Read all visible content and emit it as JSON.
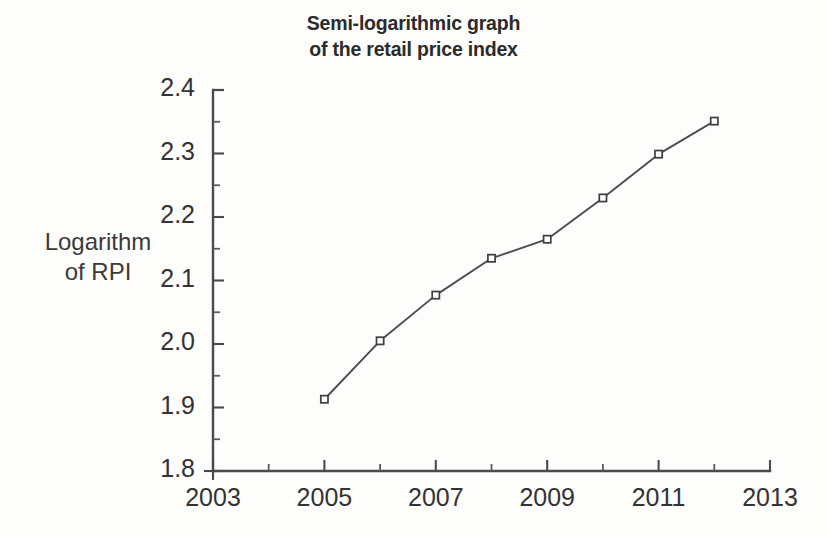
{
  "title": {
    "line1": "Semi-logarithmic graph",
    "line2": "of the retail price index"
  },
  "y_axis_title": {
    "line1": "Logarithm",
    "line2": "of RPI"
  },
  "chart_data": {
    "type": "line",
    "title": "Semi-logarithmic graph of the retail price index",
    "subtitle": "",
    "xlabel": "",
    "ylabel": "Logarithm of RPI",
    "xlim": [
      2003,
      2013
    ],
    "ylim": [
      1.8,
      2.4
    ],
    "grid": false,
    "legend": "none",
    "x_tick_labels": [
      "2003",
      "2005",
      "2007",
      "2009",
      "2011",
      "2013"
    ],
    "x_tick_values": [
      2003,
      2005,
      2007,
      2009,
      2011,
      2013
    ],
    "x_minor_tick_values": [
      2004,
      2006,
      2008,
      2010,
      2012
    ],
    "y_tick_labels": [
      "1.8",
      "1.9",
      "2.0",
      "2.1",
      "2.2",
      "2.3",
      "2.4"
    ],
    "y_tick_values": [
      1.8,
      1.9,
      2.0,
      2.1,
      2.2,
      2.3,
      2.4
    ],
    "y_minor_tick_values": [
      1.85,
      1.95,
      2.05,
      2.15,
      2.25,
      2.35
    ],
    "marker": "open-square",
    "line_color": "#4c4c53",
    "marker_face_color": "#ffffff",
    "marker_edge_color": "#3d3d44",
    "x": [
      2005,
      2006,
      2007,
      2008,
      2009,
      2010,
      2011,
      2012
    ],
    "values": [
      1.913,
      2.005,
      2.077,
      2.135,
      2.165,
      2.23,
      2.299,
      2.351
    ],
    "series": [
      {
        "name": "Logarithm of RPI",
        "x": [
          2005,
          2006,
          2007,
          2008,
          2009,
          2010,
          2011,
          2012
        ],
        "values": [
          1.913,
          2.005,
          2.077,
          2.135,
          2.165,
          2.23,
          2.299,
          2.351
        ]
      }
    ]
  },
  "geometry": {
    "plot_left": 213,
    "plot_right": 770,
    "plot_top": 90,
    "plot_bottom": 471
  },
  "colors": {
    "background": "#fdfdfc",
    "ink": "#333333",
    "axis": "#4a4a4a",
    "series": "#4c4c53"
  }
}
